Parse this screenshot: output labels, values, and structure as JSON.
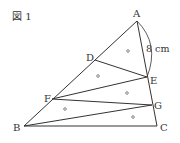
{
  "figure": {
    "title": "図 1",
    "stroke_color": "#333333",
    "points": {
      "A": {
        "label": "A",
        "x": 137,
        "y": 21
      },
      "B": {
        "label": "B",
        "x": 24,
        "y": 126
      },
      "C": {
        "label": "C",
        "x": 157,
        "y": 126
      },
      "D": {
        "label": "D",
        "x": 95,
        "y": 60
      },
      "E": {
        "label": "E",
        "x": 147,
        "y": 77
      },
      "F": {
        "label": "F",
        "x": 52,
        "y": 99
      },
      "G": {
        "label": "G",
        "x": 152,
        "y": 105
      }
    },
    "measurement": {
      "label": "8 cm",
      "segment": "AE"
    },
    "equal_area_mark": "○",
    "triangles": [
      "ADE",
      "DEF",
      "EFG",
      "FGB",
      "BGC"
    ]
  }
}
